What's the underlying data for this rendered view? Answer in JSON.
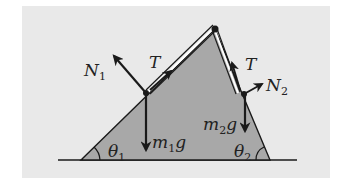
{
  "diagram": {
    "colors": {
      "background": "#e9e9e9",
      "wedge": "#a8a8a8",
      "ink": "#1a1a1a"
    },
    "labels": {
      "N1": {
        "main": "N",
        "sub": "1"
      },
      "T1": {
        "main": "T"
      },
      "m1g": {
        "pre": "m",
        "sub": "1",
        "post": "g"
      },
      "theta1": {
        "main": "θ",
        "sub": "1"
      },
      "T2": {
        "main": "T"
      },
      "N2": {
        "main": "N",
        "sub": "2"
      },
      "m2g": {
        "pre": "m",
        "sub": "2",
        "post": "g"
      },
      "theta2": {
        "main": "θ",
        "sub": "2"
      }
    }
  }
}
